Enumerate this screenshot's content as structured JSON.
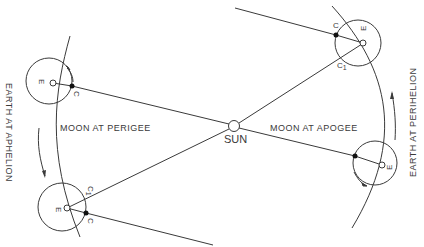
{
  "diagram": {
    "labels": {
      "sun": "SUN",
      "moon_perigee": "MOON AT PERIGEE",
      "moon_apogee": "MOON AT APOGEE",
      "earth_aphelion": "EARTH AT APHELION",
      "earth_perihelion": "EARTH AT PERIHELION"
    },
    "points": {
      "earth": "E",
      "moon_c": "C",
      "moon_c1_main": "C",
      "moon_c1_sub": "1"
    },
    "colors": {
      "line": "#3a3a3a",
      "background": "#ffffff"
    }
  }
}
